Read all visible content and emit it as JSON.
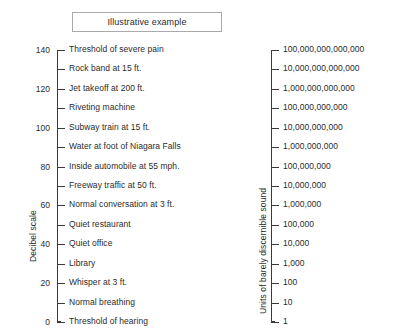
{
  "title": {
    "text": "Illustrative example"
  },
  "chart_data": {
    "type": "table",
    "title": "Illustrative example",
    "grid": false,
    "legend": "none",
    "axes": [
      {
        "name": "decibel-scale",
        "position": "left",
        "axis_title": "Decibel scale",
        "range": [
          0,
          140
        ],
        "tick_step": 10,
        "labeled_every": 20
      },
      {
        "name": "sound-units-scale",
        "position": "right",
        "axis_title": "Units of barely discernible sound",
        "range": [
          1,
          100000000000000
        ],
        "scale": "log10",
        "tick_step_exponent": 1
      }
    ],
    "left_scale": {
      "axis_title": "Decibel scale",
      "ticks": [
        {
          "value": "140",
          "label": "Threshold of severe pain"
        },
        {
          "value": "",
          "label": "Rock band at 15 ft."
        },
        {
          "value": "120",
          "label": "Jet takeoff at 200 ft."
        },
        {
          "value": "",
          "label": "Riveting machine"
        },
        {
          "value": "100",
          "label": "Subway train at 15 ft."
        },
        {
          "value": "",
          "label": "Water at foot of Niagara Falls"
        },
        {
          "value": "80",
          "label": "Inside automobile at 55 mph."
        },
        {
          "value": "",
          "label": "Freeway traffic at 50 ft."
        },
        {
          "value": "60",
          "label": "Normal conversation at 3 ft."
        },
        {
          "value": "",
          "label": "Quiet restaurant"
        },
        {
          "value": "40",
          "label": "Quiet office"
        },
        {
          "value": "",
          "label": "Library"
        },
        {
          "value": "20",
          "label": "Whisper at 3 ft."
        },
        {
          "value": "",
          "label": "Normal breathing"
        },
        {
          "value": "0",
          "label": "Threshold of hearing"
        }
      ]
    },
    "right_scale": {
      "axis_title": "Units of barely discernible sound",
      "ticks": [
        {
          "label": "100,000,000,000,000"
        },
        {
          "label": "10,000,000,000,000"
        },
        {
          "label": "1,000,000,000,000"
        },
        {
          "label": "100,000,000,000"
        },
        {
          "label": "10,000,000,000"
        },
        {
          "label": "1,000,000,000"
        },
        {
          "label": "100,000,000"
        },
        {
          "label": "10,000,000"
        },
        {
          "label": "1,000,000"
        },
        {
          "label": "100,000"
        },
        {
          "label": "10,000"
        },
        {
          "label": "1,000"
        },
        {
          "label": "100"
        },
        {
          "label": "10"
        },
        {
          "label": "1"
        }
      ]
    }
  },
  "colors": {
    "background": "#ffffff",
    "text": "#2b2b2b",
    "axis": "#3a3a3a",
    "box_border": "#aaaaaa"
  }
}
